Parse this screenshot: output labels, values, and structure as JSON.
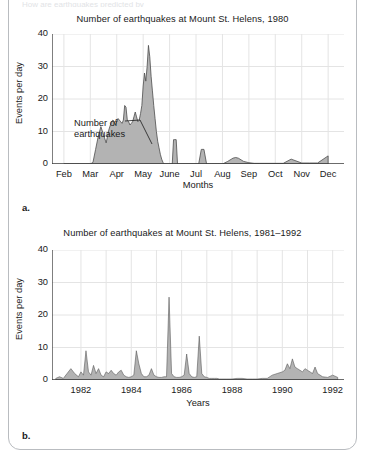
{
  "page": {
    "clipped_top_text": "How are earthquakes predicted by",
    "frame_color": "#b9bcc0"
  },
  "style": {
    "area_fill": "#b3b3b3",
    "area_stroke": "#4d4d4d",
    "grid_color": "#e4e4e4",
    "axis_color": "#3a3a3a",
    "text_color": "#1a1a1a"
  },
  "figures": [
    {
      "id": "a",
      "panel_letter": "a.",
      "chart_data": {
        "type": "area",
        "title": "Number of earthquakes at Mount St. Helens, 1980",
        "xlabel": "Months",
        "ylabel": "Events per day",
        "ylim": [
          0,
          40
        ],
        "yticks": [
          40,
          30,
          20,
          10,
          0
        ],
        "grid": true,
        "legend": "none",
        "annotation": {
          "text_line1": "Number of",
          "text_line2": "earthquakes",
          "points_to": "the shaded curve"
        },
        "categories": [
          "Feb",
          "Mar",
          "Apr",
          "May",
          "June",
          "Jul",
          "Aug",
          "Sep",
          "Oct",
          "Nov",
          "Dec"
        ],
        "xlim": [
          "Feb",
          "Dec"
        ],
        "series": [
          {
            "name": "Events per day",
            "x": [
              1.0,
              1.2,
              1.4,
              1.6,
              1.8,
              2.0,
              2.1,
              2.2,
              2.3,
              2.4,
              2.5,
              2.6,
              2.7,
              2.8,
              2.85,
              2.9,
              2.95,
              3.0,
              3.05,
              3.1,
              3.15,
              3.2,
              3.25,
              3.3,
              3.35,
              3.4,
              3.45,
              3.5,
              3.55,
              3.6,
              3.65,
              3.7,
              3.75,
              3.8,
              3.85,
              3.9,
              3.95,
              4.0,
              4.05,
              4.1,
              4.15,
              4.2,
              4.25,
              4.3,
              4.35,
              4.4,
              4.45,
              4.5,
              4.55,
              4.6,
              4.65,
              4.7,
              4.75,
              4.8,
              4.85,
              4.9,
              4.95,
              5.0,
              5.05,
              5.1,
              5.15,
              5.2,
              5.25,
              5.3,
              5.4,
              5.5,
              5.6,
              5.7,
              5.8,
              5.9,
              6.0,
              6.1,
              6.2,
              6.3,
              6.4,
              6.5,
              6.6,
              6.7,
              6.8,
              6.9,
              7.0,
              7.2,
              7.4,
              7.5,
              7.6,
              7.8,
              8.0,
              8.2,
              8.4,
              8.6,
              8.8,
              9.0,
              9.3,
              9.6,
              10.0,
              10.3,
              10.6,
              11.0
            ],
            "values": [
              0,
              0,
              0,
              0,
              0,
              0,
              0.5,
              4.5,
              8.5,
              11.5,
              9.0,
              6.5,
              10.5,
              13.0,
              13.5,
              13.2,
              12.0,
              13.0,
              14.0,
              13.5,
              13.0,
              12.5,
              13.5,
              18.0,
              17.5,
              13.5,
              13.0,
              12.0,
              12.5,
              13.0,
              14.5,
              16.0,
              14.5,
              13.0,
              13.5,
              15.5,
              18.0,
              24.0,
              28.0,
              25.5,
              30.0,
              36.5,
              33.0,
              27.0,
              22.5,
              18.0,
              14.0,
              10.0,
              7.0,
              5.0,
              3.0,
              1.5,
              0.5,
              0,
              0,
              0,
              0,
              0,
              0,
              0,
              7.5,
              7.5,
              7.5,
              0,
              0,
              0,
              0,
              0,
              0,
              0,
              0,
              0,
              4.5,
              4.5,
              0,
              0,
              0,
              0,
              0,
              0,
              0,
              0.8,
              1.8,
              2.0,
              1.8,
              0.8,
              0.4,
              0.2,
              0.2,
              0.2,
              0.2,
              0.2,
              0.2,
              1.5,
              0.3,
              0.3,
              0.3,
              2.5
            ]
          }
        ]
      }
    },
    {
      "id": "b",
      "panel_letter": "b.",
      "chart_data": {
        "type": "area",
        "title": "Number of earthquakes at Mount St. Helens, 1981–1992",
        "xlabel": "Years",
        "ylabel": "Events per day",
        "ylim": [
          0,
          40
        ],
        "yticks": [
          40,
          30,
          20,
          10,
          0
        ],
        "grid": true,
        "legend": "none",
        "categories": [
          "1982",
          "1984",
          "1986",
          "1988",
          "1990",
          "1992"
        ],
        "xlim": [
          1981.0,
          1992.3
        ],
        "series": [
          {
            "name": "Events per day",
            "x": [
              1981.0,
              1981.15,
              1981.3,
              1981.45,
              1981.6,
              1981.75,
              1981.9,
              1982.0,
              1982.1,
              1982.2,
              1982.3,
              1982.4,
              1982.5,
              1982.6,
              1982.7,
              1982.8,
              1982.9,
              1983.0,
              1983.1,
              1983.2,
              1983.3,
              1983.4,
              1983.5,
              1983.6,
              1983.7,
              1983.8,
              1983.9,
              1984.0,
              1984.1,
              1984.2,
              1984.3,
              1984.4,
              1984.5,
              1984.6,
              1984.7,
              1984.8,
              1984.9,
              1985.0,
              1985.1,
              1985.2,
              1985.3,
              1985.4,
              1985.5,
              1985.6,
              1985.7,
              1985.8,
              1985.9,
              1986.0,
              1986.1,
              1986.2,
              1986.3,
              1986.4,
              1986.5,
              1986.6,
              1986.7,
              1986.8,
              1986.9,
              1987.0,
              1987.1,
              1987.2,
              1987.3,
              1987.4,
              1987.5,
              1987.6,
              1987.8,
              1988.0,
              1988.2,
              1988.4,
              1988.6,
              1988.8,
              1989.0,
              1989.2,
              1989.4,
              1989.6,
              1989.8,
              1990.0,
              1990.1,
              1990.2,
              1990.3,
              1990.4,
              1990.5,
              1990.6,
              1990.7,
              1990.8,
              1990.9,
              1991.0,
              1991.1,
              1991.2,
              1991.3,
              1991.4,
              1991.6,
              1991.8,
              1992.0,
              1992.2
            ],
            "values": [
              0.5,
              1.0,
              0.5,
              2.0,
              3.5,
              2.0,
              1.0,
              2.5,
              1.5,
              9.0,
              2.5,
              1.5,
              4.5,
              2.0,
              3.5,
              1.5,
              1.0,
              2.5,
              2.0,
              3.0,
              2.0,
              1.5,
              2.5,
              3.0,
              1.5,
              1.0,
              0.8,
              1.0,
              1.5,
              9.0,
              5.0,
              2.0,
              1.0,
              1.0,
              1.5,
              3.5,
              1.5,
              1.0,
              0.8,
              0.8,
              1.0,
              1.0,
              25.5,
              2.0,
              1.0,
              0.8,
              0.8,
              1.0,
              1.5,
              8.0,
              2.0,
              1.0,
              0.8,
              1.0,
              13.5,
              2.0,
              1.0,
              0.8,
              0.5,
              0.5,
              0.5,
              0.5,
              0.3,
              0.3,
              0.3,
              0.3,
              0.5,
              0.5,
              0.3,
              0.3,
              0.3,
              0.5,
              0.5,
              1.5,
              2.0,
              2.5,
              3.0,
              5.0,
              3.5,
              6.5,
              4.0,
              3.5,
              3.0,
              2.5,
              3.5,
              3.0,
              2.5,
              2.0,
              4.0,
              2.0,
              1.0,
              0.8,
              1.5,
              0.8,
              0.5,
              0.3
            ]
          }
        ]
      }
    }
  ]
}
